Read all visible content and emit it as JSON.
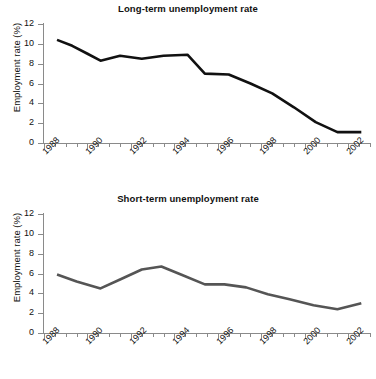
{
  "figure": {
    "width": 376,
    "height": 379,
    "background": "#ffffff"
  },
  "chart_data": [
    {
      "type": "line",
      "panel": "top",
      "title": "Long-term unemployment rate",
      "xlabel": "",
      "ylabel": "Employment rate (%)",
      "ylim": [
        0,
        12
      ],
      "yticks": [
        0,
        2,
        4,
        6,
        8,
        10,
        12
      ],
      "xlim": [
        1988,
        2003
      ],
      "xticks": [
        1988,
        1990,
        1992,
        1994,
        1996,
        1998,
        2000,
        2002
      ],
      "xticklabels": [
        "1988",
        "1990",
        "1992",
        "1994",
        "1996",
        "1998",
        "2000",
        "2002"
      ],
      "minor_xticks_per_interval": 1,
      "grid": false,
      "legend": "none",
      "line_color": "#111111",
      "line_width": 2.6,
      "x": [
        1988.6,
        1989.3,
        1990.0,
        1990.6,
        1991.5,
        1992.5,
        1993.5,
        1994.6,
        1995.4,
        1996.5,
        1997.5,
        1998.5,
        1999.5,
        2000.5,
        2001.5,
        2002.6
      ],
      "values": [
        10.4,
        9.8,
        9.0,
        8.3,
        8.8,
        8.5,
        8.8,
        8.9,
        7.0,
        6.9,
        6.0,
        5.0,
        3.6,
        2.1,
        1.1,
        1.1
      ]
    },
    {
      "type": "line",
      "panel": "bottom",
      "title": "Short-term unemployment rate",
      "xlabel": "",
      "ylabel": "Employment rate (%)",
      "ylim": [
        0,
        12
      ],
      "yticks": [
        0,
        2,
        4,
        6,
        8,
        10,
        12
      ],
      "xlim": [
        1988,
        2003
      ],
      "xticks": [
        1988,
        1990,
        1992,
        1994,
        1996,
        1998,
        2000,
        2002
      ],
      "xticklabels": [
        "1988",
        "1990",
        "1992",
        "1994",
        "1996",
        "1998",
        "2000",
        "2002"
      ],
      "minor_xticks_per_interval": 1,
      "grid": false,
      "legend": "none",
      "line_color": "#555555",
      "line_width": 2.6,
      "x": [
        1988.6,
        1989.5,
        1990.6,
        1991.5,
        1992.5,
        1993.4,
        1994.3,
        1995.4,
        1996.3,
        1997.3,
        1998.3,
        1999.3,
        2000.4,
        2001.5,
        2002.6
      ],
      "values": [
        5.9,
        5.2,
        4.5,
        5.4,
        6.4,
        6.7,
        5.9,
        4.9,
        4.9,
        4.6,
        3.9,
        3.4,
        2.8,
        2.4,
        3.0
      ]
    }
  ]
}
